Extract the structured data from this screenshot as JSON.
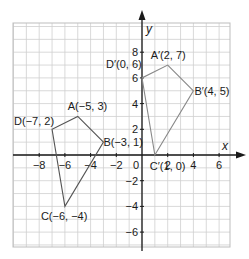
{
  "diagram": {
    "type": "coordinate-plane-transformation",
    "axes": {
      "x_label": "x",
      "y_label": "y",
      "x_ticks": [
        {
          "value": -8,
          "label": "−8"
        },
        {
          "value": -6,
          "label": "−6"
        },
        {
          "value": -4,
          "label": "−4"
        },
        {
          "value": -2,
          "label": "−2"
        },
        {
          "value": 2,
          "label": "2"
        },
        {
          "value": 4,
          "label": "4"
        },
        {
          "value": 6,
          "label": "6"
        }
      ],
      "y_ticks": [
        {
          "value": 8,
          "label": "8"
        },
        {
          "value": 6,
          "label": "6"
        },
        {
          "value": 4,
          "label": "4"
        },
        {
          "value": 2,
          "label": "2"
        },
        {
          "value": -2,
          "label": "−2"
        },
        {
          "value": -4,
          "label": "−4"
        },
        {
          "value": -6,
          "label": "−6"
        }
      ],
      "origin_label": "0",
      "grid_x_range": [
        -10,
        7
      ],
      "grid_y_range": [
        -7,
        10
      ]
    },
    "shapes": [
      {
        "name": "ABCD",
        "color": "#555555",
        "vertices": [
          {
            "id": "A",
            "x": -5,
            "y": 3,
            "label": "A(−5, 3)"
          },
          {
            "id": "B",
            "x": -3,
            "y": 1,
            "label": "B(−3, 1)"
          },
          {
            "id": "C",
            "x": -6,
            "y": -4,
            "label": "C(−6, −4)"
          },
          {
            "id": "D",
            "x": -7,
            "y": 2,
            "label": "D(−7, 2)"
          }
        ]
      },
      {
        "name": "A'B'C'D'",
        "color": "#888888",
        "vertices": [
          {
            "id": "A'",
            "x": 2,
            "y": 7,
            "label": "A′(2, 7)"
          },
          {
            "id": "B'",
            "x": 4,
            "y": 5,
            "label": "B′(4, 5)"
          },
          {
            "id": "C'",
            "x": 1,
            "y": 0,
            "label": "C′(1, 0)"
          },
          {
            "id": "D'",
            "x": 0,
            "y": 6,
            "label": "D′(0, 6)"
          }
        ]
      }
    ],
    "colors": {
      "grid": "#cfcfcf",
      "axis": "#1a1a1a",
      "frame": "#bdbdbd"
    }
  }
}
